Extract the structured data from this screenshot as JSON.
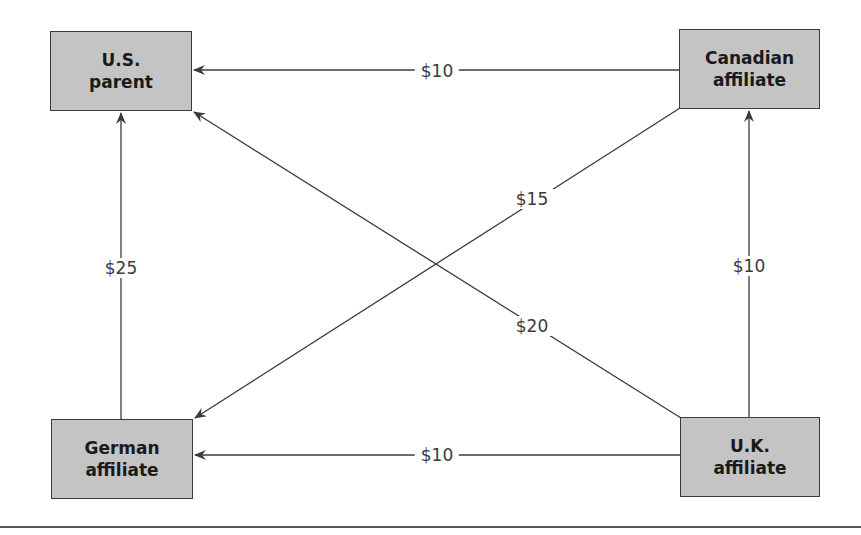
{
  "diagram": {
    "type": "flow-diagram",
    "nodes": [
      {
        "id": "us",
        "line1": "U.S.",
        "line2": "parent",
        "x": 50,
        "y": 31,
        "w": 142,
        "h": 80
      },
      {
        "id": "ca",
        "line1": "Canadian",
        "line2": "affiliate",
        "x": 679,
        "y": 29,
        "w": 141,
        "h": 80
      },
      {
        "id": "de",
        "line1": "German",
        "line2": "affiliate",
        "x": 51,
        "y": 419,
        "w": 142,
        "h": 80
      },
      {
        "id": "uk",
        "line1": "U.K.",
        "line2": "affiliate",
        "x": 680,
        "y": 417,
        "w": 140,
        "h": 80
      }
    ],
    "edges": [
      {
        "from": "ca",
        "to": "us",
        "label": "$10",
        "label_x": 437,
        "label_y": 71
      },
      {
        "from": "de",
        "to": "us",
        "label": "$25",
        "label_x": 121,
        "label_y": 268
      },
      {
        "from": "uk",
        "to": "ca",
        "label": "$10",
        "label_x": 749,
        "label_y": 266
      },
      {
        "from": "uk",
        "to": "de",
        "label": "$10",
        "label_x": 437,
        "label_y": 455
      },
      {
        "from": "ca",
        "to": "de",
        "label": "$15",
        "label_x": 532,
        "label_y": 199
      },
      {
        "from": "uk",
        "to": "us",
        "label": "$20",
        "label_x": 532,
        "label_y": 326
      }
    ]
  },
  "colors": {
    "box_fill": "#c4c4c4",
    "box_border": "#3a3a3a",
    "line": "#3a3a3a",
    "text": "#1a1a1a"
  }
}
